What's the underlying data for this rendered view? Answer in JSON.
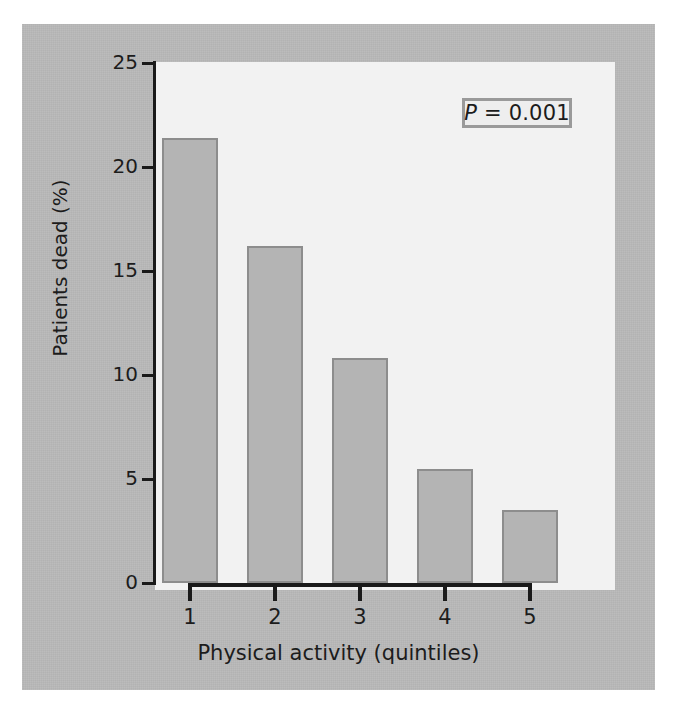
{
  "chart_data": {
    "type": "bar",
    "title": "",
    "subtitle": "",
    "xlabel": "Physical activity (quintiles)",
    "ylabel": "Patients dead (%)",
    "categories": [
      "1",
      "2",
      "3",
      "4",
      "5"
    ],
    "values": [
      21.4,
      16.2,
      10.8,
      5.5,
      3.5
    ],
    "series": [
      {
        "name": "Patients dead (%)",
        "values": [
          21.4,
          16.2,
          10.8,
          5.5,
          3.5
        ]
      }
    ],
    "ylim": [
      0,
      25
    ],
    "yticks": [
      0,
      5,
      10,
      15,
      20,
      25
    ],
    "ytick_labels": [
      "0",
      "5",
      "10",
      "15",
      "20",
      "25"
    ],
    "xtick_labels": [
      "1",
      "2",
      "3",
      "4",
      "5"
    ],
    "grid": false,
    "legend": false,
    "legend_position": "none",
    "annotations": [
      {
        "name": "p-value",
        "symbol": "P",
        "text": " = 0.001",
        "full_text": "P = 0.001",
        "position": "top-right"
      }
    ],
    "colors": {
      "bar_fill": "#b4b4b4",
      "bar_border": "#8d8d8d",
      "plot_background": "#f2f2f2",
      "figure_background": "#b9b9b9",
      "axis": "#1a1a1a",
      "text": "#1c1c1c",
      "annotation_border": "#9a9a9a",
      "annotation_fill": "#eeeeee"
    }
  }
}
